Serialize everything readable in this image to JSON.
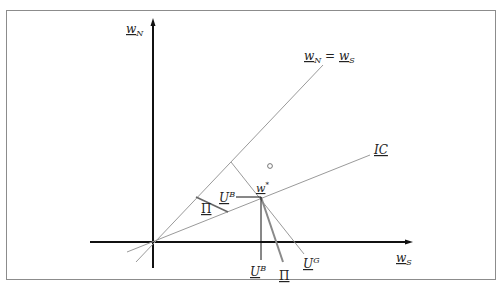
{
  "diagram": {
    "title": "",
    "axes": {
      "y_label": {
        "base": "w",
        "sub": "N"
      },
      "x_label": {
        "base": "w",
        "sub": "S"
      }
    },
    "lines": {
      "diagonal": {
        "label_left": {
          "base": "w",
          "sub": "N"
        },
        "equals": "=",
        "label_right": {
          "base": "w",
          "sub": "S"
        }
      },
      "ic": {
        "label": "IC"
      }
    },
    "point": {
      "base": "w",
      "sup": "*"
    },
    "labels": {
      "u_b_upper": {
        "base": "U",
        "sup": "B"
      },
      "pi_upper": "Π",
      "u_b_lower": {
        "base": "U",
        "sup": "B"
      },
      "pi_lower": "Π",
      "u_g": {
        "base": "U",
        "sup": "G"
      }
    },
    "colors": {
      "axis": "#111111",
      "thin_line": "#9a9a9a",
      "frame": "#8c8c8c",
      "pi_line": "#7a7a7a"
    }
  }
}
